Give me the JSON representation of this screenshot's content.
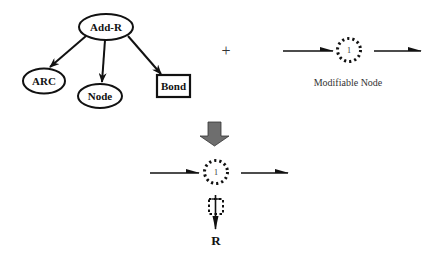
{
  "diagram": {
    "tree": {
      "root": {
        "label": "Add-R",
        "shape": "ellipse"
      },
      "children": [
        {
          "label": "ARC",
          "shape": "ellipse"
        },
        {
          "label": "Node",
          "shape": "ellipse"
        },
        {
          "label": "Bond",
          "shape": "rectangle"
        }
      ]
    },
    "operator": "+",
    "modifiable_node": {
      "number": "1",
      "caption": "Modifiable Node",
      "style": "dotted-circle"
    },
    "transform_arrow": {
      "direction": "down",
      "color": "#6e6e6e"
    },
    "result": {
      "node_number": "1",
      "attached_label": "R"
    },
    "colors": {
      "stroke": "#111111",
      "background": "#ffffff",
      "block_arrow": "#6e6e6e"
    }
  }
}
